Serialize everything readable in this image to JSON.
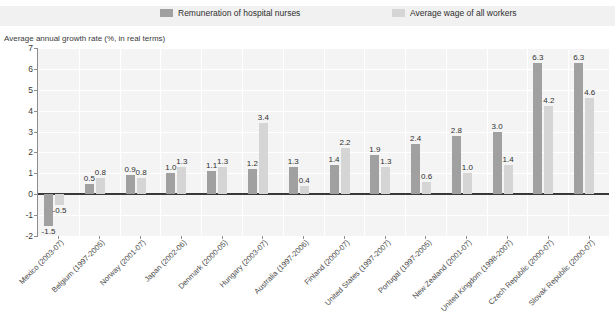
{
  "chart_data": {
    "type": "bar",
    "title": "",
    "xlabel": "",
    "ylabel": "Average annual growth rate (%, in real terms)",
    "ylim": [
      -2,
      7
    ],
    "yticks": [
      7,
      6,
      5,
      4,
      3,
      2,
      1,
      0,
      -1,
      -2
    ],
    "grid": true,
    "legend_position": "top",
    "categories": [
      "Mexico (2003-07)",
      "Belgium (1997-2005)",
      "Norway (2001-07)",
      "Japan (2002-06)",
      "Denmark (2000-05)",
      "Hungary (2003-07)",
      "Australia (1997-2006)",
      "Finland (2000-07)",
      "United States (1997-2007)",
      "Portugal (1997-2005)",
      "New Zealand (2001-07)",
      "United Kingdom (1998-2007)",
      "Czech Republic (2000-07)",
      "Slovak Republic (2000-07)"
    ],
    "series": [
      {
        "name": "Remuneration of hospital nurses",
        "color": "#a0a0a0",
        "values": [
          -1.5,
          0.5,
          0.9,
          1.0,
          1.1,
          1.2,
          1.3,
          1.4,
          1.9,
          2.4,
          2.8,
          3.0,
          6.3,
          6.3
        ]
      },
      {
        "name": "Average wage of all workers",
        "color": "#d5d5d5",
        "values": [
          -0.5,
          0.8,
          0.8,
          1.3,
          1.3,
          3.4,
          0.4,
          2.2,
          1.3,
          0.6,
          1.0,
          1.4,
          4.2,
          4.6
        ]
      }
    ]
  },
  "legend": {
    "items": [
      {
        "label": "Remuneration of hospital nurses",
        "color": "#a0a0a0"
      },
      {
        "label": "Average wage of all workers",
        "color": "#d5d5d5"
      }
    ]
  },
  "axis": {
    "y_title": "Average annual growth rate (%, in real terms)"
  }
}
